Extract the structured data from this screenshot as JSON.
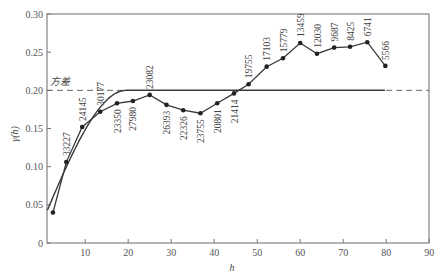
{
  "chart_data": {
    "type": "line",
    "title": "",
    "xlabel": "h",
    "ylabel": "γ(h)",
    "xlim": [
      1.2,
      90
    ],
    "ylim": [
      0,
      0.3
    ],
    "xticks": [
      10,
      20,
      30,
      40,
      50,
      60,
      70,
      80,
      90
    ],
    "yticks": [
      0,
      0.05,
      0.1,
      0.15,
      0.2,
      0.25,
      0.3
    ],
    "ytick_labels": [
      "0",
      "0.05",
      "0.10",
      "0.15",
      "0.20",
      "0.25",
      "0.30"
    ],
    "grid": false,
    "legend": null,
    "annotations": [
      {
        "text": "方差",
        "x": 3,
        "y": 0.205,
        "note": "sill line label"
      }
    ],
    "series": [
      {
        "name": "experimental variogram",
        "style": "line-with-markers",
        "x": [
          2.5,
          5.6,
          9.3,
          13.5,
          17.4,
          21.1,
          25.0,
          28.9,
          32.8,
          36.8,
          40.7,
          44.6,
          48.0,
          52.2,
          56.0,
          60.0,
          63.9,
          67.9,
          71.6,
          75.6,
          79.8
        ],
        "y": [
          0.04,
          0.106,
          0.152,
          0.172,
          0.183,
          0.186,
          0.194,
          0.181,
          0.174,
          0.17,
          0.183,
          0.196,
          0.208,
          0.231,
          0.242,
          0.262,
          0.248,
          0.256,
          0.257,
          0.263,
          0.232
        ],
        "labels": [
          "",
          "33227",
          "24145",
          "30177",
          "23350",
          "27980",
          "23082",
          "26393",
          "22326",
          "23755",
          "20801",
          "21414",
          "19755",
          "17103",
          "15779",
          "13459",
          "12030",
          "9687",
          "8425",
          "6741",
          "5566"
        ]
      },
      {
        "name": "spherical model",
        "style": "smooth-line",
        "nugget": 0.027,
        "sill": 0.2,
        "range": 19.5,
        "x": [
          1.2,
          5,
          10,
          15,
          19.5,
          80
        ],
        "y": [
          0.029,
          0.085,
          0.15,
          0.19,
          0.2,
          0.2
        ]
      },
      {
        "name": "variance (sill)",
        "style": "dashed",
        "y": 0.2,
        "note": "dashed where not overlapping model curve"
      }
    ]
  }
}
